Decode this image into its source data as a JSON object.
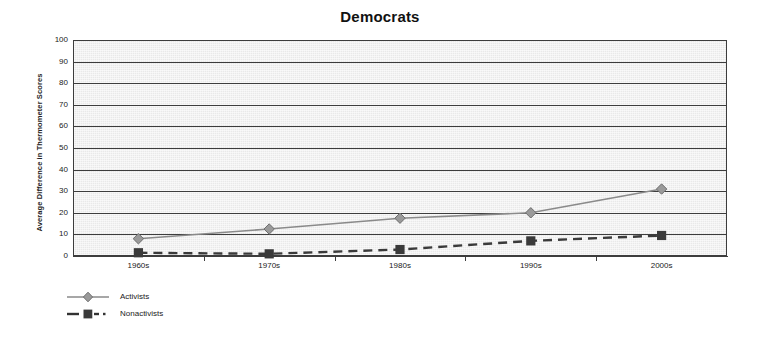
{
  "chart_data": {
    "type": "line",
    "title": "Democrats",
    "xlabel": "",
    "ylabel": "Average Difference in Thermometer Scores",
    "categories": [
      "1960s",
      "1970s",
      "1980s",
      "1990s",
      "2000s"
    ],
    "series": [
      {
        "name": "Activists",
        "values": [
          8,
          12.5,
          17.5,
          20,
          31
        ],
        "marker": "diamond",
        "line_style": "solid",
        "color": "#8a8a8a"
      },
      {
        "name": "Nonactivists",
        "values": [
          1.5,
          1,
          3,
          7,
          9.5
        ],
        "marker": "square",
        "line_style": "dashed",
        "color": "#3a3a3a"
      }
    ],
    "ylim": [
      0,
      100
    ],
    "y_ticks": [
      0,
      10,
      20,
      30,
      40,
      50,
      60,
      70,
      80,
      90,
      100
    ],
    "y_tick_labels": [
      "0",
      "10",
      "20",
      "30",
      "40",
      "50",
      "60",
      "70",
      "80",
      "90",
      "100"
    ],
    "grid": true,
    "legend_position": "bottom-left",
    "plot_background": "#e9e9e9",
    "gridline_color": "#3d3d3d"
  },
  "legend": {
    "items": [
      {
        "label": "Activists"
      },
      {
        "label": "Nonactivists"
      }
    ]
  }
}
